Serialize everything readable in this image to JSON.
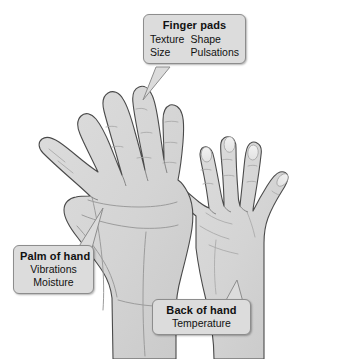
{
  "figure": {
    "background_color": "#ffffff",
    "hand_fill_color": "#d5d5d5",
    "hand_outline_color": "#4a4a4a",
    "callout_fill_color": "#dcdcdc",
    "callout_border_color": "#8d8d8d",
    "text_color": "#111111"
  },
  "hands": [
    {
      "name": "left-hand-palm",
      "view": "palm",
      "label_ref": "Palm of hand"
    },
    {
      "name": "right-hand-back",
      "view": "dorsal",
      "label_ref": "Back of hand"
    }
  ],
  "callouts": {
    "finger_pads": {
      "title": "Finger pads",
      "col_left": [
        "Texture",
        "Size"
      ],
      "col_right": [
        "Shape",
        "Pulsations"
      ]
    },
    "palm": {
      "title": "Palm of hand",
      "lines": [
        "Vibrations",
        "Moisture"
      ]
    },
    "back": {
      "title": "Back of hand",
      "lines": [
        "Temperature"
      ]
    }
  }
}
